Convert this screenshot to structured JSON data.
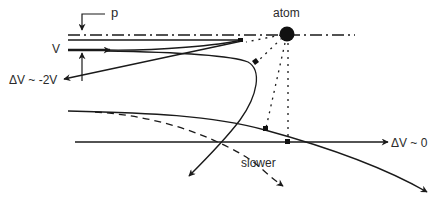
{
  "diagram": {
    "title": "",
    "colors": {
      "ink": "#1a1a1a",
      "background": "#ffffff"
    },
    "labels": {
      "impact_parameter": "p",
      "atom": "atom",
      "velocity": "V",
      "backscatter_delta": "ΔV ~ -2V",
      "forward_delta": "ΔV ~ 0",
      "slower": "slower"
    },
    "elements": [
      {
        "id": "axis",
        "kind": "dash-dot line",
        "description": "horizontal axis through atom"
      },
      {
        "id": "atom",
        "kind": "filled circle",
        "label": "atom"
      },
      {
        "id": "impact-parameter-marker",
        "kind": "bracket arrow",
        "label": "p"
      },
      {
        "id": "incoming-trajectory-head-on",
        "kind": "arrow",
        "label": "V"
      },
      {
        "id": "reflected-trajectory",
        "kind": "arrow",
        "label": "ΔV ~ -2V"
      },
      {
        "id": "looping-trajectory",
        "kind": "curve with arrow"
      },
      {
        "id": "straight-trajectory",
        "kind": "arrow",
        "label": "ΔV ~ 0"
      },
      {
        "id": "deflected-trajectory",
        "kind": "curve with arrow"
      },
      {
        "id": "slower-trajectory",
        "kind": "dashed curve with arrow",
        "label": "slower"
      },
      {
        "id": "closest-approach-lines",
        "kind": "dotted lines",
        "description": "from atom to points of closest approach"
      }
    ]
  }
}
